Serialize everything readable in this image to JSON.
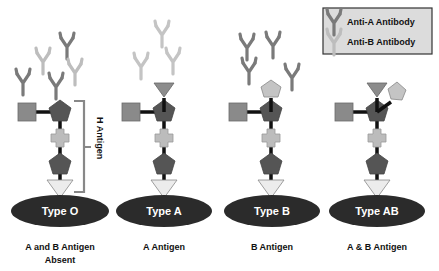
{
  "legend": {
    "items": [
      {
        "label": "Anti-A Antibody",
        "color": "#7a7a7a"
      },
      {
        "label": "Anti-B Antibody",
        "color": "#bdbdbd"
      }
    ]
  },
  "bracket_label": "H Antigen",
  "blood_types": [
    {
      "name": "Type O",
      "caption_line1": "A and B Antigen",
      "caption_line2": "Absent"
    },
    {
      "name": "Type A",
      "caption_line1": "A Antigen",
      "caption_line2": ""
    },
    {
      "name": "Type B",
      "caption_line1": "B Antigen",
      "caption_line2": ""
    },
    {
      "name": "Type AB",
      "caption_line1": "A & B Antigen",
      "caption_line2": ""
    }
  ],
  "colors": {
    "cell": "#2b2b2b",
    "dark_pentagon": "#555555",
    "square": "#8a8a8a",
    "cross": "#bcbcbc",
    "triangle_light": "#e8e8e8",
    "a_triangle": "#8c8c8c",
    "b_pentagon": "#c4c4c4",
    "bracket": "#888888"
  }
}
